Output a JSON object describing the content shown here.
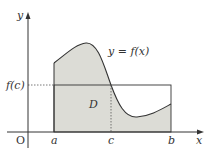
{
  "diagram": {
    "type": "mean-value-theorem-for-integrals",
    "colors": {
      "background": "#ffffff",
      "shade": "#dcdcd6",
      "stroke": "#333333"
    },
    "labels": {
      "y_axis": "y",
      "x_axis": "x",
      "origin": "O",
      "curve": "y = f(x)",
      "f_c": "f(c)",
      "region": "D",
      "a": "a",
      "c": "c",
      "b": "b"
    }
  }
}
